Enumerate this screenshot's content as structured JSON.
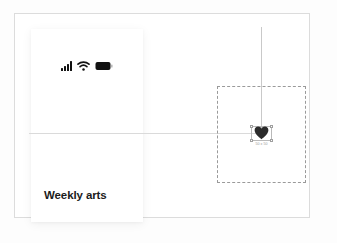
{
  "canvas": {
    "background_color": "#fdfdfd",
    "artboard_border_color": "#dcdcdc",
    "guide_color": "#c9c9c9"
  },
  "guides": {
    "vertical_name": "vertical-alignment-guide",
    "horizontal_name": "horizontal-alignment-guide"
  },
  "card": {
    "title": "Weekly arts",
    "background_color": "#ffffff",
    "statusbar": {
      "icons": [
        {
          "name": "signal-icon",
          "bars": 4,
          "label": "signal"
        },
        {
          "name": "wifi-icon",
          "label": "wifi"
        },
        {
          "name": "battery-icon",
          "label": "battery",
          "level": "full"
        }
      ],
      "icon_color": "#111111"
    }
  },
  "selection": {
    "frame_name": "dashed-selection-frame",
    "frame_border_color": "#9a9a9a",
    "object": {
      "name": "heart-icon",
      "color": "#2b2b2b",
      "dimension_label": "50 x 50",
      "handles": [
        "top-left",
        "top-right",
        "bottom-left",
        "bottom-right"
      ],
      "handle_color": "#9f9f9f"
    }
  }
}
